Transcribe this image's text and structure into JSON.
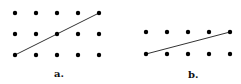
{
  "panels": [
    {
      "label": "a.",
      "label_pos": [
        54,
        68
      ],
      "dots": {
        "xs": [
          15,
          36,
          57,
          78,
          99
        ],
        "ys": [
          13,
          34,
          55
        ]
      },
      "line": [
        [
          15,
          55
        ],
        [
          99,
          13
        ]
      ]
    },
    {
      "label": "b.",
      "label_pos": [
        188,
        69
      ],
      "dots": {
        "xs": [
          146,
          167,
          188,
          209,
          230
        ],
        "ys": [
          32,
          54
        ]
      },
      "line": [
        [
          146,
          54
        ],
        [
          230,
          32
        ]
      ]
    }
  ],
  "colors": {
    "dot": "#000000",
    "line": "#333333",
    "background": "#ffffff"
  }
}
